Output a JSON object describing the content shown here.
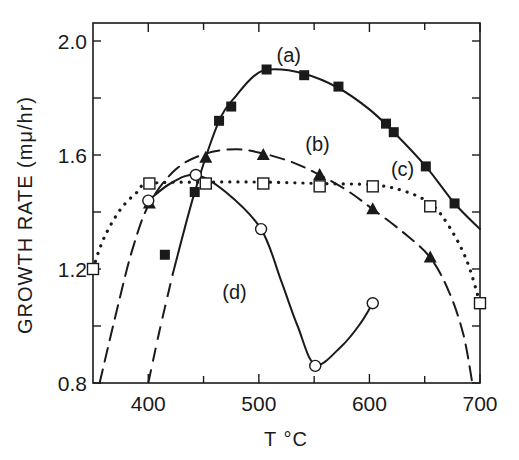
{
  "chart_data": {
    "type": "line",
    "title": "",
    "xlabel": "T °C",
    "ylabel": "GROWTH RATE (mμ/hr)",
    "xlim": [
      350,
      700
    ],
    "ylim": [
      0.8,
      2.05
    ],
    "x_ticks": [
      400,
      450,
      500,
      550,
      600,
      650,
      700
    ],
    "x_tick_labels": [
      "400",
      "500",
      "600",
      "700"
    ],
    "x_labeled_ticks": [
      400,
      500,
      600,
      700
    ],
    "y_ticks": [
      0.8,
      1.0,
      1.2,
      1.4,
      1.6,
      1.8,
      2.0
    ],
    "y_tick_labels": [
      "0.8",
      "1.2",
      "1.6",
      "2.0"
    ],
    "y_labeled_ticks": [
      0.8,
      1.2,
      1.6,
      2.0
    ],
    "grid": false,
    "legend": "inline labels",
    "series": [
      {
        "name": "(a)",
        "marker": "filled-square",
        "line": "solid",
        "label_pos": [
          527,
          1.95
        ],
        "points": [
          [
            415,
            1.25
          ],
          [
            442,
            1.47
          ],
          [
            464,
            1.72
          ],
          [
            475,
            1.77
          ],
          [
            507,
            1.9
          ],
          [
            541,
            1.88
          ],
          [
            572,
            1.84
          ],
          [
            615,
            1.71
          ],
          [
            622,
            1.68
          ],
          [
            651,
            1.56
          ],
          [
            677,
            1.43
          ]
        ],
        "curve": [
          [
            422,
            1.18
          ],
          [
            442,
            1.47
          ],
          [
            464,
            1.72
          ],
          [
            480,
            1.81
          ],
          [
            495,
            1.875
          ],
          [
            510,
            1.9
          ],
          [
            541,
            1.885
          ],
          [
            572,
            1.835
          ],
          [
            600,
            1.76
          ],
          [
            622,
            1.68
          ],
          [
            651,
            1.56
          ],
          [
            677,
            1.43
          ],
          [
            700,
            1.34
          ]
        ],
        "extrapolation": [
          [
            400,
            0.8
          ],
          [
            410,
            0.98
          ],
          [
            422,
            1.18
          ]
        ]
      },
      {
        "name": "(b)",
        "marker": "filled-triangle",
        "line": "dashed",
        "label_pos": [
          553,
          1.64
        ],
        "points": [
          [
            401,
            1.43
          ],
          [
            452,
            1.59
          ],
          [
            504,
            1.6
          ],
          [
            555,
            1.53
          ],
          [
            603,
            1.41
          ],
          [
            655,
            1.24
          ]
        ],
        "curve": [
          [
            356,
            0.8
          ],
          [
            370,
            1.03
          ],
          [
            385,
            1.26
          ],
          [
            401,
            1.43
          ],
          [
            425,
            1.55
          ],
          [
            452,
            1.605
          ],
          [
            480,
            1.62
          ],
          [
            504,
            1.605
          ],
          [
            530,
            1.575
          ],
          [
            555,
            1.53
          ],
          [
            580,
            1.475
          ],
          [
            603,
            1.41
          ],
          [
            630,
            1.33
          ],
          [
            655,
            1.24
          ],
          [
            672,
            1.12
          ],
          [
            685,
            0.97
          ],
          [
            693,
            0.8
          ]
        ]
      },
      {
        "name": "(c)",
        "marker": "open-square",
        "line": "dotted",
        "label_pos": [
          630,
          1.55
        ],
        "points": [
          [
            350,
            1.2
          ],
          [
            401,
            1.5
          ],
          [
            452,
            1.5
          ],
          [
            504,
            1.5
          ],
          [
            555,
            1.49
          ],
          [
            603,
            1.49
          ],
          [
            655,
            1.42
          ],
          [
            700,
            1.08
          ]
        ],
        "curve": [
          [
            350,
            1.2
          ],
          [
            360,
            1.31
          ],
          [
            375,
            1.41
          ],
          [
            390,
            1.47
          ],
          [
            401,
            1.5
          ],
          [
            452,
            1.505
          ],
          [
            504,
            1.505
          ],
          [
            555,
            1.5
          ],
          [
            603,
            1.495
          ],
          [
            630,
            1.475
          ],
          [
            655,
            1.43
          ],
          [
            672,
            1.35
          ],
          [
            688,
            1.23
          ],
          [
            700,
            1.08
          ]
        ]
      },
      {
        "name": "(d)",
        "marker": "open-circle",
        "line": "solid",
        "label_pos": [
          478,
          1.12
        ],
        "points": [
          [
            400,
            1.44
          ],
          [
            443,
            1.53
          ],
          [
            502,
            1.34
          ],
          [
            551,
            0.86
          ],
          [
            603,
            1.08
          ]
        ],
        "curve": [
          [
            400,
            1.44
          ],
          [
            420,
            1.5
          ],
          [
            443,
            1.53
          ],
          [
            470,
            1.47
          ],
          [
            502,
            1.34
          ],
          [
            520,
            1.16
          ],
          [
            535,
            1.0
          ],
          [
            551,
            0.865
          ],
          [
            575,
            0.93
          ],
          [
            592,
            1.01
          ],
          [
            603,
            1.08
          ]
        ]
      }
    ]
  },
  "axes": {
    "x_title": "T °C",
    "y_title": "GROWTH RATE (mμ/hr)"
  },
  "style": {
    "ink": "#1a1a1a",
    "background": "#ffffff"
  }
}
